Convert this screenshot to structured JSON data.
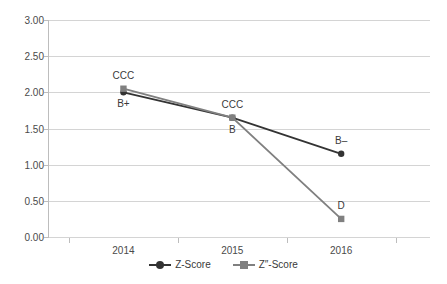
{
  "chart_data": {
    "type": "line",
    "title": "",
    "xlabel": "",
    "ylabel": "",
    "categories": [
      "2014",
      "2015",
      "2016"
    ],
    "ylim": [
      0.0,
      3.0
    ],
    "ytick_labels": [
      "0.00",
      "0.50",
      "1.00",
      "1.50",
      "2.00",
      "2.50",
      "3.00"
    ],
    "ytick_values": [
      0.0,
      0.5,
      1.0,
      1.5,
      2.0,
      2.5,
      3.0
    ],
    "grid": true,
    "legend_position": "bottom-center",
    "series": [
      {
        "name": "Z-Score",
        "color": "#333333",
        "marker": "circle",
        "values": [
          2.0,
          1.65,
          1.15
        ],
        "point_labels": [
          "B+",
          "B",
          "B–"
        ],
        "point_label_positions": [
          "below",
          "below",
          "above"
        ]
      },
      {
        "name": "Z″-Score",
        "color": "#808080",
        "marker": "square",
        "values": [
          2.05,
          1.65,
          0.25
        ],
        "point_labels": [
          "CCC",
          "CCC",
          "D"
        ],
        "point_label_positions": [
          "above",
          "above",
          "above"
        ]
      }
    ]
  },
  "legend": {
    "items": [
      {
        "label": "Z-Score",
        "color": "#333333",
        "marker": "circle"
      },
      {
        "label": "Z″-Score",
        "color": "#808080",
        "marker": "square"
      }
    ]
  },
  "colors": {
    "grid": "#d4d4d4",
    "axis": "#bdbdbd",
    "text": "#3a3a3a",
    "background": "#ffffff",
    "series_primary": "#333333",
    "series_secondary": "#808080"
  }
}
